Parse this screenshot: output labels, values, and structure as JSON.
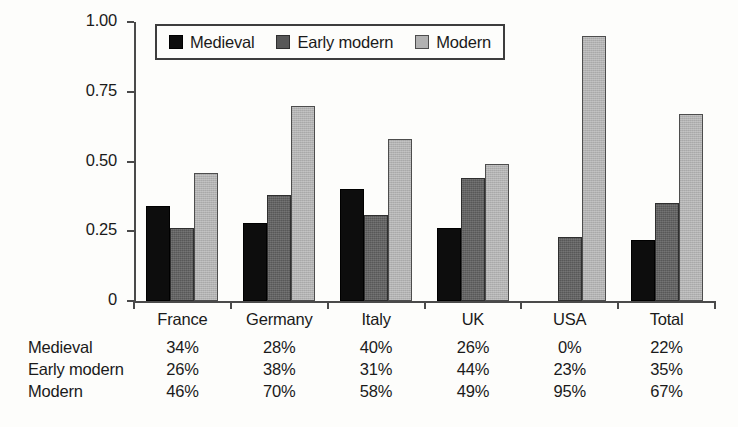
{
  "chart_data": {
    "type": "bar",
    "title": "",
    "subtitle": "",
    "xlabel": "",
    "ylabel": "",
    "ylim": [
      0,
      1.0
    ],
    "yticks": [
      "0",
      "0.25",
      "0.50",
      "0.75",
      "1.00"
    ],
    "ytick_values": [
      0,
      0.25,
      0.5,
      0.75,
      1.0
    ],
    "grid": false,
    "legend_position": "top-left-inside",
    "categories": [
      "France",
      "Germany",
      "Italy",
      "UK",
      "USA",
      "Total"
    ],
    "series": [
      {
        "name": "Medieval",
        "color": "#0d0d0d",
        "values": [
          0.34,
          0.28,
          0.4,
          0.26,
          0.0,
          0.22
        ],
        "labels": [
          "34%",
          "28%",
          "40%",
          "26%",
          "0%",
          "22%"
        ]
      },
      {
        "name": "Early modern",
        "color": "#585858",
        "values": [
          0.26,
          0.38,
          0.31,
          0.44,
          0.23,
          0.35
        ],
        "labels": [
          "26%",
          "38%",
          "31%",
          "44%",
          "23%",
          "35%"
        ]
      },
      {
        "name": "Modern",
        "color": "#b2b2b2",
        "values": [
          0.46,
          0.7,
          0.58,
          0.49,
          0.95,
          0.67
        ],
        "labels": [
          "46%",
          "70%",
          "58%",
          "49%",
          "95%",
          "67%"
        ]
      }
    ]
  },
  "legend": {
    "items": [
      {
        "label": "Medieval"
      },
      {
        "label": "Early modern"
      },
      {
        "label": "Modern"
      }
    ]
  },
  "table": {
    "column_headers": [
      "France",
      "Germany",
      "Italy",
      "UK",
      "USA",
      "Total"
    ],
    "rows": [
      {
        "label": "Medieval",
        "cells": [
          "34%",
          "28%",
          "40%",
          "26%",
          "0%",
          "22%"
        ]
      },
      {
        "label": "Early modern",
        "cells": [
          "26%",
          "38%",
          "31%",
          "44%",
          "23%",
          "35%"
        ]
      },
      {
        "label": "Modern",
        "cells": [
          "46%",
          "70%",
          "58%",
          "49%",
          "95%",
          "67%"
        ]
      }
    ]
  },
  "axis": {
    "y_tick_labels": [
      "1.00",
      "0.75",
      "0.50",
      "0.25",
      "0"
    ]
  }
}
